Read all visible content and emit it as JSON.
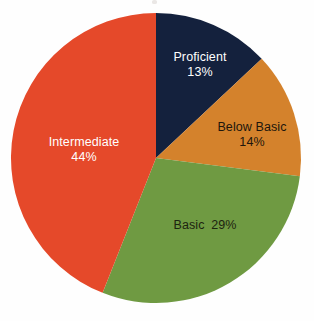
{
  "chart_data": {
    "type": "pie",
    "title": "",
    "subtitle": "",
    "xlabel": "",
    "ylabel": "",
    "legend_position": "none",
    "grid": false,
    "labels_inside_slices": true,
    "start_angle_deg": 0,
    "direction": "clockwise",
    "categories": [
      "Proficient",
      "Below Basic",
      "Basic",
      "Intermediate"
    ],
    "values": [
      13,
      14,
      29,
      44
    ],
    "value_unit": "percent",
    "slices": [
      {
        "label": "Proficient",
        "value": 13,
        "value_text": "13%",
        "label_text": "Proficient",
        "color": "#14213d",
        "text_color": "#ffffff",
        "label_style": "stacked"
      },
      {
        "label": "Below Basic",
        "value": 14,
        "value_text": "14%",
        "label_text": "Below Basic",
        "color": "#d4822c",
        "text_color": "#20160c",
        "label_style": "stacked"
      },
      {
        "label": "Basic",
        "value": 29,
        "value_text": "29%",
        "label_text": "Basic",
        "color": "#6f9a42",
        "text_color": "#1d2410",
        "label_style": "inline"
      },
      {
        "label": "Intermediate",
        "value": 44,
        "value_text": "44%",
        "label_text": "Intermediate",
        "color": "#e5492a",
        "text_color": "#ffffff",
        "label_style": "stacked"
      }
    ]
  },
  "canvas": {
    "background_color": "#fefefe",
    "center_x": 156,
    "center_y": 158,
    "radius": 145
  }
}
